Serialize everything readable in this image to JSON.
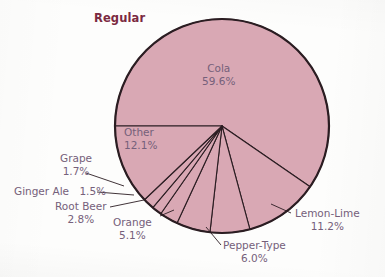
{
  "chart_data": {
    "type": "pie",
    "title": "Regular",
    "xlabel": "",
    "ylabel": "",
    "legend": "none",
    "grid": false,
    "categories": [
      "Cola",
      "Lemon-Lime",
      "Pepper-Type",
      "Orange",
      "Root Beer",
      "Ginger Ale",
      "Grape",
      "Other"
    ],
    "values": [
      59.6,
      11.2,
      6.0,
      5.1,
      2.8,
      1.5,
      1.7,
      12.1
    ],
    "value_labels": [
      "59.6%",
      "11.2%",
      "6.0%",
      "5.1%",
      "2.8%",
      "1.5%",
      "1.7%",
      "12.1%"
    ],
    "units": "percent",
    "slice_color": "#d9a8b4",
    "slice_outline": "#2b1d22",
    "label_color": "#75607a",
    "title_color": "#7b2a41",
    "background_color": "#fdfdfc"
  },
  "title": {
    "text": "Regular"
  },
  "slices": {
    "cola": {
      "name": "Cola",
      "value": "59.6%"
    },
    "other": {
      "name": "Other",
      "value": "12.1%"
    },
    "grape": {
      "name": "Grape",
      "value": "1.7%"
    },
    "ginger_ale": {
      "name": "Ginger Ale",
      "value": "1.5%"
    },
    "root_beer": {
      "name": "Root Beer",
      "value": "2.8%"
    },
    "orange": {
      "name": "Orange",
      "value": "5.1%"
    },
    "pepper_type": {
      "name": "Pepper-Type",
      "value": "6.0%"
    },
    "lemon_lime": {
      "name": "Lemon-Lime",
      "value": "11.2%"
    }
  }
}
